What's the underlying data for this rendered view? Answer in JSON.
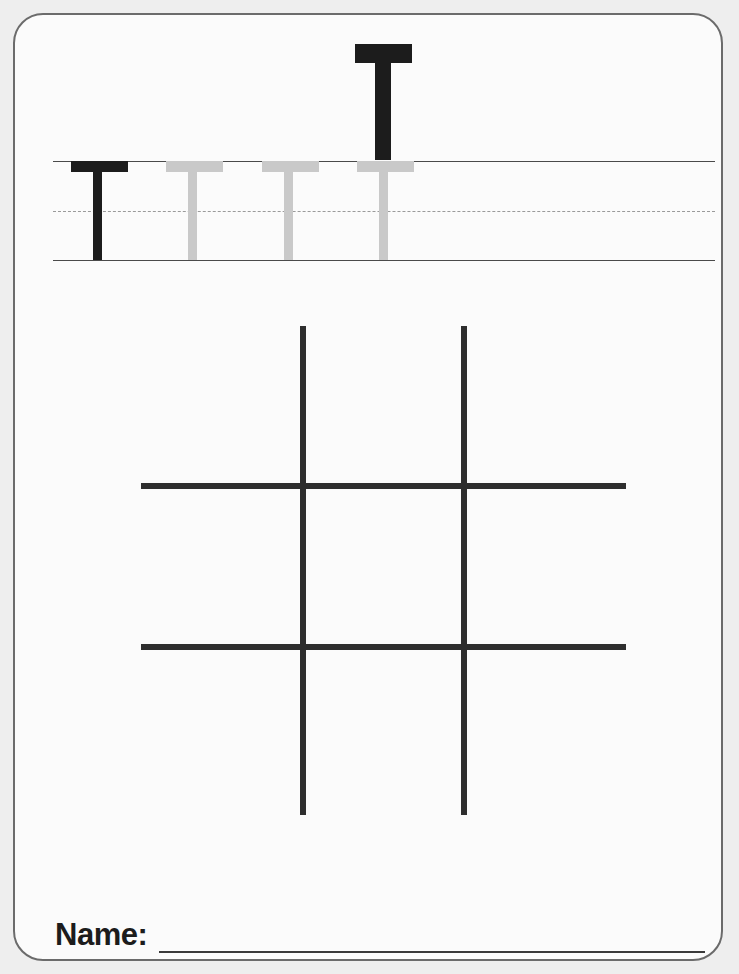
{
  "page": {
    "width": 739,
    "height": 974,
    "background_color": "#eeeeee",
    "sheet_color": "#fbfbfb",
    "border_color": "#6b6b6b",
    "worksheet_type": "letter-tracing-worksheet",
    "letter": "T"
  },
  "hero": {
    "letter": "T",
    "color": "#1c1c1c",
    "icon_name": "letter-t-uppercase"
  },
  "practice_row": {
    "guide_lines": [
      {
        "name": "top-solid-line",
        "style": "solid",
        "y": 146,
        "color": "#4a4a4a"
      },
      {
        "name": "middle-dashed-line",
        "style": "dashed",
        "y": 196,
        "color": "#9a9a9a"
      },
      {
        "name": "bottom-solid-line",
        "style": "solid",
        "y": 245,
        "color": "#4a4a4a"
      }
    ],
    "line_start_x": 38,
    "line_end_x": 700,
    "letters": [
      {
        "letter": "T",
        "mode": "example",
        "color": "#1c1c1c",
        "x": 56
      },
      {
        "letter": "T",
        "mode": "trace",
        "color": "#c9c9c9",
        "x": 151
      },
      {
        "letter": "T",
        "mode": "trace",
        "color": "#c9c9c9",
        "x": 247
      },
      {
        "letter": "T",
        "mode": "trace",
        "color": "#c9c9c9",
        "x": 342
      }
    ]
  },
  "hash_grid": {
    "name": "tic-tac-toe-grid",
    "stroke_color": "#2e2e2e",
    "stroke_width": 6,
    "vertical_lines_x": [
      288,
      449
    ],
    "horizontal_lines_y": [
      471,
      632
    ],
    "vertical_span_y": [
      311,
      800
    ],
    "horizontal_span_x": [
      126,
      611
    ]
  },
  "footer": {
    "name_label": "Name:",
    "blank_line_color": "#3a3a3a"
  }
}
